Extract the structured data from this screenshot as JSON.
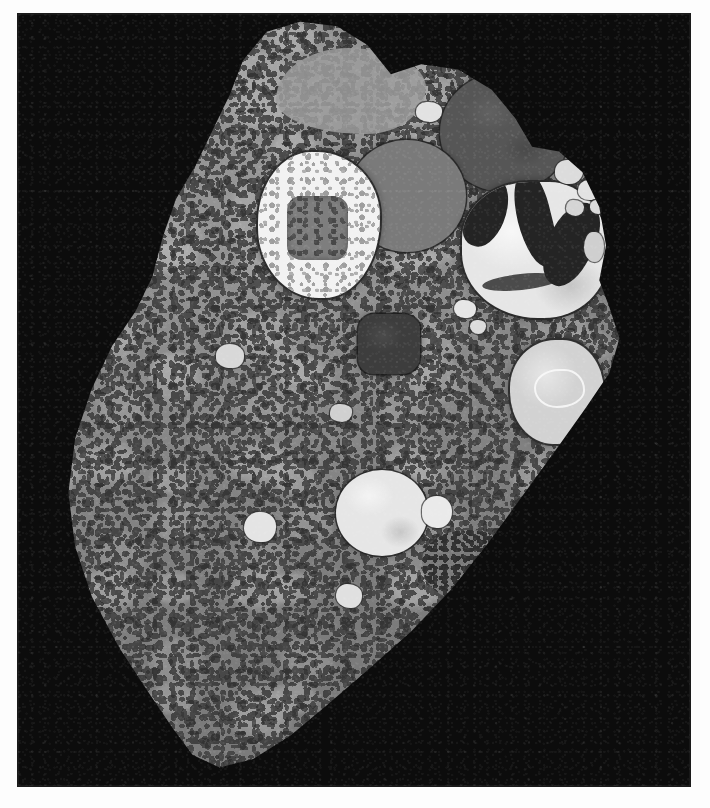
{
  "figure": {
    "kind": "transmission-electron-micrograph",
    "caption": "",
    "background_color": "#0c0c0c",
    "page_color": "#fdfdfd",
    "plate": {
      "x": 18,
      "y": 14,
      "width": 672,
      "height": 772
    },
    "scale_bar": null,
    "labels": [],
    "annotations": []
  },
  "palette": {
    "background": "#0c0c0c",
    "cytoplasm": "#8f8f8f",
    "cytoplasm_speckle": "#343434",
    "nucleus": "#565656",
    "vacuole_gray": "#7a7a7a",
    "vacuole_dark": "#4a4a4a",
    "lipid_bright": "#e6e6e6",
    "vesicle_bright": "#e2e2e2",
    "granular_vacuole": "#f2f2f2",
    "membrane_outline": "#2a2a2a",
    "crystal_cleft": "#242424"
  },
  "structures": [
    {
      "id": "cell-outline",
      "name": "cell-section-outline",
      "role": "plasma membrane boundary of the sectioned cell"
    },
    {
      "id": "cytoplasm",
      "name": "cytoplasm",
      "role": "granular electron-lucent ground substance with ribosome speckle"
    },
    {
      "id": "nucleus",
      "name": "nucleus",
      "role": "large electron-dense round organelle, upper right",
      "x": 422,
      "y": 58,
      "w": 130,
      "h": 120,
      "tone": "#565656"
    },
    {
      "id": "vac-granular",
      "name": "granular-vacuole",
      "role": "vacuole with bright granular content and gray core, upper left",
      "x": 240,
      "y": 138,
      "w": 122,
      "h": 146,
      "tone": "#f2f2f2"
    },
    {
      "id": "vac-gray-upper",
      "name": "gray-vacuole",
      "role": "round medium-gray vacuole, upper middle",
      "x": 330,
      "y": 126,
      "w": 118,
      "h": 112,
      "tone": "#7a7a7a"
    },
    {
      "id": "lipid-body",
      "name": "lipid-body-with-clefts",
      "role": "large bright lipid inclusion traversed by dark crystalline clefts, right",
      "x": 444,
      "y": 168,
      "w": 146,
      "h": 136,
      "tone": "#e6e6e6"
    },
    {
      "id": "dark-block",
      "name": "dark-blocky-organelle",
      "role": "small electron-dense blocky body, centre",
      "x": 340,
      "y": 300,
      "w": 62,
      "h": 60,
      "tone": "#3d3d3d"
    },
    {
      "id": "ring-organelle",
      "name": "ring-inclusion-organelle",
      "role": "pale oval organelle with bright internal ring, mid right",
      "x": 492,
      "y": 326,
      "w": 94,
      "h": 104,
      "tone": "#d2d2d2"
    },
    {
      "id": "lipid-lower",
      "name": "lipid-droplet-lower",
      "role": "large bright lipid droplet, lower centre",
      "x": 318,
      "y": 456,
      "w": 92,
      "h": 86,
      "tone": "#e6e6e6"
    },
    {
      "id": "dense-patch",
      "name": "dense-speckled-patch",
      "role": "densely speckled cytoplasmic patch, lower centre-right",
      "x": 404,
      "y": 516,
      "w": 90,
      "h": 70,
      "tone": "#7d7d7d"
    },
    {
      "id": "vesicle-cluster",
      "name": "peripheral-vesicle-cluster",
      "role": "cluster of small bright vesicles along upper-right cell margin"
    },
    {
      "id": "small-vesicles",
      "name": "small-bright-vesicles",
      "role": "scattered small electron-lucent vesicles throughout cytoplasm"
    }
  ],
  "vesicles": [
    {
      "x": 398,
      "y": 88,
      "w": 26,
      "h": 20,
      "tone": "#e2e2e2"
    },
    {
      "x": 537,
      "y": 146,
      "w": 28,
      "h": 24,
      "tone": "#dcdcdc"
    },
    {
      "x": 560,
      "y": 166,
      "w": 22,
      "h": 20,
      "tone": "#e2e2e2"
    },
    {
      "x": 548,
      "y": 186,
      "w": 18,
      "h": 16,
      "tone": "#d5d5d5"
    },
    {
      "x": 572,
      "y": 186,
      "w": 14,
      "h": 14,
      "tone": "#dadada"
    },
    {
      "x": 598,
      "y": 258,
      "w": 30,
      "h": 32,
      "tone": "#efefef"
    },
    {
      "x": 436,
      "y": 286,
      "w": 22,
      "h": 18,
      "tone": "#e6e6e6"
    },
    {
      "x": 452,
      "y": 306,
      "w": 16,
      "h": 14,
      "tone": "#dcdcdc"
    },
    {
      "x": 198,
      "y": 330,
      "w": 28,
      "h": 24,
      "tone": "#d8d8d8"
    },
    {
      "x": 312,
      "y": 390,
      "w": 22,
      "h": 18,
      "tone": "#d0d0d0"
    },
    {
      "x": 226,
      "y": 498,
      "w": 32,
      "h": 30,
      "tone": "#e4e4e4"
    },
    {
      "x": 404,
      "y": 482,
      "w": 30,
      "h": 32,
      "tone": "#eaeaea"
    },
    {
      "x": 318,
      "y": 570,
      "w": 26,
      "h": 24,
      "tone": "#e0e0e0"
    },
    {
      "x": 566,
      "y": 218,
      "w": 20,
      "h": 30,
      "tone": "#cfcfcf"
    },
    {
      "x": 596,
      "y": 160,
      "w": 16,
      "h": 18,
      "tone": "#d4d4d4"
    }
  ]
}
